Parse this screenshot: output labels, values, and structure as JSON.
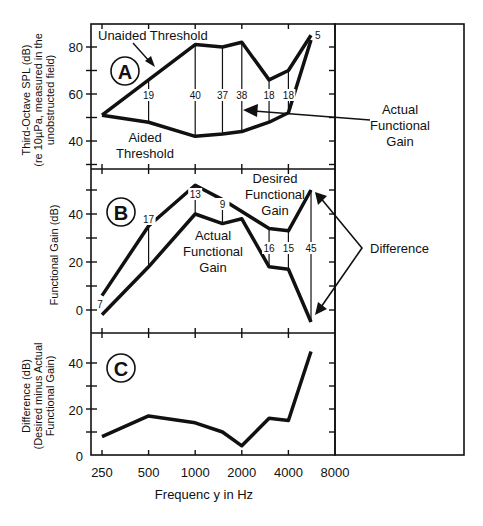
{
  "figure": {
    "xlabel": "Frequenc y in Hz",
    "x_tick_labels": [
      "250",
      "500",
      "1000",
      "2000",
      "4000",
      "8000"
    ]
  },
  "panels": {
    "A": {
      "badge": "A",
      "ylabel_lines": [
        "Third-Octave SPL (dB)",
        "(re 10µPa, measured in the",
        "unobstructed field)"
      ],
      "y_tick_labels": [
        "80",
        "60",
        "40"
      ],
      "labels": {
        "unaided_threshold": "Unaided Threshold",
        "aided_line1": "Aided",
        "aided_line2": "Threshold",
        "afg_line1": "Actual",
        "afg_line2": "Functional",
        "afg_line3": "Gain"
      }
    },
    "B": {
      "badge": "B",
      "ylabel": "Functional Gain (dB)",
      "y_tick_labels": [
        "40",
        "20",
        "0"
      ],
      "labels": {
        "desired_line1": "Desired",
        "desired_line2": "Functional",
        "desired_line3": "Gain",
        "actual_line1": "Actual",
        "actual_line2": "Functional",
        "actual_line3": "Gain",
        "difference": "Difference"
      }
    },
    "C": {
      "badge": "C",
      "ylabel_lines": [
        "Difference (dB)",
        "(Desired minus Actual",
        "Functional Gain)"
      ],
      "y_tick_labels": [
        "40",
        "20",
        "0"
      ]
    }
  },
  "chart_data": [
    {
      "type": "line",
      "title": "A",
      "xlabel": "Frequency in Hz",
      "ylabel": "Third-Octave SPL (dB) (re 10µPa, measured in the unobstructed field)",
      "x": [
        250,
        500,
        1000,
        1500,
        2000,
        3000,
        4000,
        5600
      ],
      "xscale": "log2",
      "xlim": [
        250,
        8000
      ],
      "ylim": [
        30,
        90
      ],
      "series": [
        {
          "name": "Unaided Threshold",
          "values": [
            51,
            66,
            81,
            80,
            82,
            66,
            70,
            85
          ]
        },
        {
          "name": "Aided Threshold",
          "values": [
            51,
            48,
            42,
            43,
            44,
            48,
            52,
            83
          ]
        }
      ],
      "annotations": {
        "actual_functional_gain_values": [
          "",
          "19",
          "40",
          "37",
          "38",
          "18",
          "18",
          "5"
        ],
        "arrow_label": "Actual Functional Gain"
      }
    },
    {
      "type": "line",
      "title": "B",
      "xlabel": "Frequency in Hz",
      "ylabel": "Functional Gain (dB)",
      "x": [
        250,
        500,
        1000,
        1500,
        2000,
        3000,
        4000,
        5600
      ],
      "xscale": "log2",
      "xlim": [
        250,
        8000
      ],
      "ylim": [
        -10,
        60
      ],
      "series": [
        {
          "name": "Desired Functional Gain",
          "values": [
            6,
            35,
            52,
            46,
            41,
            34,
            33,
            50
          ]
        },
        {
          "name": "Actual Functional Gain",
          "values": [
            -2,
            18,
            40,
            36,
            38,
            18,
            17,
            -5
          ]
        }
      ],
      "annotations": {
        "difference_values": [
          "7",
          "17",
          "13",
          "9",
          "",
          "16",
          "15",
          "45"
        ],
        "arrow_label": "Difference"
      }
    },
    {
      "type": "line",
      "title": "C",
      "xlabel": "Frequency in Hz",
      "ylabel": "Difference (dB) (Desired minus Actual Functional Gain)",
      "x": [
        250,
        500,
        1000,
        1500,
        2000,
        3000,
        4000,
        5600
      ],
      "xscale": "log2",
      "xlim": [
        250,
        8000
      ],
      "ylim": [
        0,
        50
      ],
      "series": [
        {
          "name": "Difference",
          "values": [
            8,
            17,
            14,
            10,
            4,
            16,
            15,
            45
          ]
        }
      ]
    }
  ]
}
